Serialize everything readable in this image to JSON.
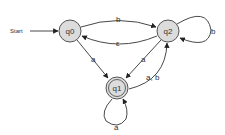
{
  "diagram": {
    "type": "finite-automaton",
    "start_label": "Start",
    "states": [
      {
        "id": "q0",
        "label": "q0",
        "accepting": false,
        "start": true
      },
      {
        "id": "q1",
        "label": "q1",
        "accepting": true,
        "start": false
      },
      {
        "id": "q2",
        "label": "q2",
        "accepting": false,
        "start": false
      }
    ],
    "transitions": [
      {
        "from": "q0",
        "to": "q2",
        "label": "b"
      },
      {
        "from": "q2",
        "to": "q0",
        "label": "ε"
      },
      {
        "from": "q0",
        "to": "q1",
        "label": "a"
      },
      {
        "from": "q2",
        "to": "q1",
        "label": "a"
      },
      {
        "from": "q1",
        "to": "q2",
        "label": "a, b"
      },
      {
        "from": "q2",
        "to": "q2",
        "label": "b"
      },
      {
        "from": "q1",
        "to": "q1",
        "label": "a"
      }
    ],
    "colors": {
      "state_fill": "#dcdcdc",
      "stroke": "#333333",
      "background": "#ffffff"
    }
  }
}
